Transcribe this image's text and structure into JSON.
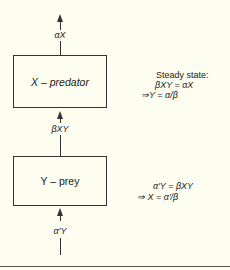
{
  "diagram": {
    "predator_box": {
      "label": "X – predator"
    },
    "prey_box": {
      "label": "Y – prey"
    },
    "flows": {
      "predator_out": "αX",
      "prey_to_predator": "βXY",
      "prey_in": "α′Y"
    },
    "predator_note": {
      "heading": "Steady state:",
      "equation": "βXY = αX",
      "result": "⇒Y = α/β"
    },
    "prey_note": {
      "equation": "α′Y = βXY",
      "result": "⇒ X = α′/β"
    }
  }
}
